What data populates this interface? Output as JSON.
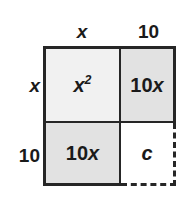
{
  "figure": {
    "colors": {
      "stroke": "#262626",
      "fill_light": "#f1f1f1",
      "fill_medium": "#e2e2e2",
      "fill_empty": "#ffffff",
      "text": "#1a1a1a"
    }
  },
  "labels": {
    "top_left": "x",
    "top_right": "10",
    "side_top": "x",
    "side_bottom": "10"
  },
  "cells": {
    "top_left": {
      "base": "x",
      "exponent": "2"
    },
    "top_right": {
      "coefficient": "10",
      "variable": "x"
    },
    "bottom_left": {
      "coefficient": "10",
      "variable": "x"
    },
    "bottom_right": {
      "variable": "c"
    }
  },
  "chart_data": {
    "type": "table",
    "column_headers": [
      "x",
      "10"
    ],
    "row_headers": [
      "x",
      "10"
    ],
    "cells": [
      [
        "x²",
        "10x"
      ],
      [
        "10x",
        "c"
      ]
    ],
    "cell_fills": [
      [
        "#f1f1f1",
        "#e2e2e2"
      ],
      [
        "#e2e2e2",
        "#ffffff"
      ]
    ],
    "cell_border_styles": [
      [
        "solid",
        "solid"
      ],
      [
        "solid",
        "dashed"
      ]
    ],
    "grid": true,
    "legend": "none"
  }
}
